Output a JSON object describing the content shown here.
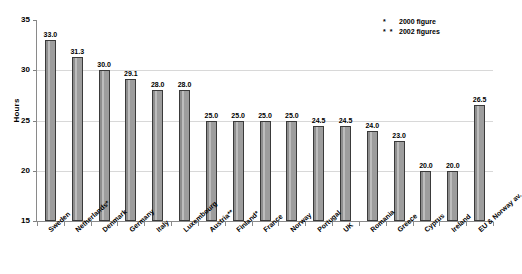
{
  "chart_data": {
    "type": "bar",
    "title": "",
    "xlabel": "",
    "ylabel": "Hours",
    "ylim": [
      15,
      35
    ],
    "yticks": [
      15,
      20,
      25,
      30,
      35
    ],
    "grid": true,
    "legend_position": "top-right",
    "categories": [
      "Sweden",
      "Netherlands*",
      "Denmark",
      "Germany",
      "Italy",
      "Luxembourg",
      "Austria**",
      "Finland*",
      "France",
      "Norway",
      "Portugal",
      "UK",
      "Romania",
      "Greece",
      "Cyprus",
      "Ireland",
      "EU & Norway av."
    ],
    "values": [
      33.0,
      31.3,
      30.0,
      29.1,
      28.0,
      28.0,
      25.0,
      25.0,
      25.0,
      25.0,
      24.5,
      24.5,
      24.0,
      23.0,
      20.0,
      20.0,
      26.5
    ],
    "value_labels": [
      "33.0",
      "31.3",
      "30.0",
      "29.1",
      "28.0",
      "28.0",
      "25.0",
      "25.0",
      "25.0",
      "25.0",
      "24.5",
      "24.5",
      "24.0",
      "23.0",
      "20.0",
      "20.0",
      "26.5"
    ],
    "annotations": [
      {
        "mark": "*",
        "text": "2000 figure"
      },
      {
        "mark": "* *",
        "text": "2002 figures"
      }
    ],
    "colors": {
      "bar_fill": "#9a9a9a",
      "bar_border": "#3a3a3a",
      "gridline": "#d8d8d8",
      "axis": "#8a8a8a",
      "text": "#000000",
      "background": "#ffffff"
    }
  },
  "axis": {
    "y_title": "Hours",
    "y_tick_labels": [
      "35",
      "30",
      "25",
      "20",
      "15"
    ]
  },
  "legend": {
    "rows": [
      {
        "mark": "*",
        "label": "2000 figure"
      },
      {
        "mark": "* *",
        "label": "2002 figures"
      }
    ]
  }
}
